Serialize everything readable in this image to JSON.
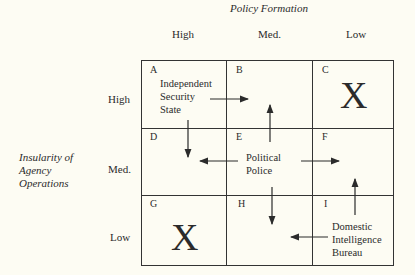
{
  "col_axis": {
    "title": "Policy Formation",
    "levels": [
      "High",
      "Med.",
      "Low"
    ]
  },
  "row_axis": {
    "title_lines": [
      "Insularity of",
      "Agency",
      "Operations"
    ],
    "levels": [
      "High",
      "Med.",
      "Low"
    ]
  },
  "cells": {
    "A": {
      "label": "A",
      "text_lines": [
        "Independent",
        "Security",
        "State"
      ]
    },
    "B": {
      "label": "B"
    },
    "C": {
      "label": "C",
      "mark": "X"
    },
    "D": {
      "label": "D"
    },
    "E": {
      "label": "E",
      "text_lines": [
        "Political",
        "Police"
      ]
    },
    "F": {
      "label": "F"
    },
    "G": {
      "label": "G",
      "mark": "X"
    },
    "H": {
      "label": "H"
    },
    "I": {
      "label": "I",
      "text_lines": [
        "Domestic",
        "Intelligence",
        "Bureau"
      ]
    }
  },
  "arrows": [
    {
      "from": "A",
      "to": "B",
      "direction": "right"
    },
    {
      "from": "A",
      "to": "D",
      "direction": "down"
    },
    {
      "from": "E",
      "to": "B",
      "direction": "up"
    },
    {
      "from": "E",
      "to": "D",
      "direction": "left"
    },
    {
      "from": "E",
      "to": "F",
      "direction": "right"
    },
    {
      "from": "E",
      "to": "H",
      "direction": "down"
    },
    {
      "from": "I",
      "to": "F",
      "direction": "up"
    },
    {
      "from": "I",
      "to": "H",
      "direction": "left"
    }
  ]
}
